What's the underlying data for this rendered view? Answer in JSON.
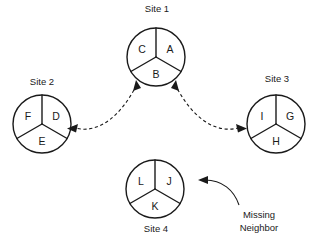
{
  "diagram": {
    "title_visible": false,
    "background_color": "#ffffff",
    "stroke_color": "#1a1a1a",
    "sites": [
      {
        "id": "site-1",
        "label": "Site 1",
        "label_position": "above",
        "center_x": 156,
        "center_y": 57,
        "radius": 29,
        "sectors": [
          {
            "key": "top-right",
            "label": "A"
          },
          {
            "key": "bottom",
            "label": "B"
          },
          {
            "key": "top-left",
            "label": "C"
          }
        ]
      },
      {
        "id": "site-2",
        "label": "Site 2",
        "label_position": "above",
        "center_x": 42,
        "center_y": 124,
        "radius": 29,
        "sectors": [
          {
            "key": "top-right",
            "label": "D"
          },
          {
            "key": "bottom",
            "label": "E"
          },
          {
            "key": "top-left",
            "label": "F"
          }
        ]
      },
      {
        "id": "site-3",
        "label": "Site 3",
        "label_position": "above",
        "center_x": 276,
        "center_y": 124,
        "radius": 29,
        "sectors": [
          {
            "key": "top-right",
            "label": "G"
          },
          {
            "key": "bottom",
            "label": "H"
          },
          {
            "key": "top-left",
            "label": "I"
          }
        ]
      },
      {
        "id": "site-4",
        "label": "Site 4",
        "label_position": "below",
        "center_x": 155,
        "center_y": 189,
        "radius": 29,
        "sectors": [
          {
            "key": "top-right",
            "label": "J"
          },
          {
            "key": "bottom",
            "label": "K"
          },
          {
            "key": "top-left",
            "label": "L"
          }
        ]
      }
    ],
    "links": [
      {
        "id": "link-site1-site2",
        "from": "Site 1",
        "to": "Site 2",
        "style": "dashed",
        "arrows": "both"
      },
      {
        "id": "link-site1-site3",
        "from": "Site 1",
        "to": "Site 3",
        "style": "dashed",
        "arrows": "both"
      }
    ],
    "annotations": [
      {
        "id": "missing-neighbor",
        "line1": "Missing",
        "line2": "Neighbor",
        "points_to": "Site 4",
        "style": "solid-curve",
        "arrows": "single"
      }
    ]
  }
}
